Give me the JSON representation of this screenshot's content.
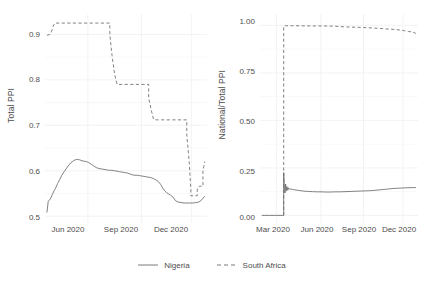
{
  "chart_data": [
    {
      "type": "line",
      "panel": "left",
      "title": "",
      "xlabel": "",
      "ylabel": "Total PPI",
      "ylim": [
        0.485,
        0.945
      ],
      "yticks": [
        0.5,
        0.6,
        0.7,
        0.8,
        0.9
      ],
      "ytick_labels": [
        "0.5",
        "0.6",
        "0.7",
        "0.8",
        "0.9"
      ],
      "xlim": [
        "2020-04-20",
        "2021-01-20"
      ],
      "xticks": [
        "Jun 2020",
        "Sep 2020",
        "Dec 2020"
      ],
      "xtick_positions": [
        0.265,
        0.595,
        0.905
      ],
      "grid": true,
      "legend_position": "bottom",
      "series": [
        {
          "name": "Nigeria",
          "style": "solid",
          "color": "#6b6b6b",
          "x": [
            0.012,
            0.02,
            0.028,
            0.036,
            0.046,
            0.056,
            0.066,
            0.078,
            0.09,
            0.102,
            0.116,
            0.13,
            0.144,
            0.158,
            0.172,
            0.186,
            0.2,
            0.214,
            0.228,
            0.242,
            0.256,
            0.27,
            0.286,
            0.3,
            0.316,
            0.332,
            0.348,
            0.364,
            0.38,
            0.396,
            0.412,
            0.428,
            0.444,
            0.46,
            0.476,
            0.492,
            0.508,
            0.524,
            0.54,
            0.556,
            0.572,
            0.588,
            0.604,
            0.62,
            0.636,
            0.652,
            0.668,
            0.684,
            0.7,
            0.714,
            0.726,
            0.738,
            0.75,
            0.762,
            0.776,
            0.79,
            0.806,
            0.822,
            0.84,
            0.858,
            0.876,
            0.894,
            0.912,
            0.93,
            0.948,
            0.962,
            0.974,
            0.986
          ],
          "y": [
            0.508,
            0.533,
            0.536,
            0.54,
            0.548,
            0.556,
            0.562,
            0.572,
            0.58,
            0.589,
            0.597,
            0.604,
            0.611,
            0.617,
            0.621,
            0.624,
            0.625,
            0.624,
            0.622,
            0.621,
            0.62,
            0.618,
            0.614,
            0.611,
            0.607,
            0.605,
            0.604,
            0.603,
            0.602,
            0.601,
            0.601,
            0.6,
            0.599,
            0.598,
            0.597,
            0.596,
            0.595,
            0.593,
            0.591,
            0.59,
            0.59,
            0.589,
            0.588,
            0.587,
            0.586,
            0.585,
            0.583,
            0.58,
            0.576,
            0.57,
            0.562,
            0.556,
            0.552,
            0.549,
            0.546,
            0.542,
            0.534,
            0.531,
            0.53,
            0.529,
            0.529,
            0.529,
            0.529,
            0.53,
            0.531,
            0.534,
            0.539,
            0.544
          ]
        },
        {
          "name": "South Africa",
          "style": "dashed",
          "color": "#6b6b6b",
          "x": [
            0.012,
            0.03,
            0.04,
            0.048,
            0.06,
            0.4,
            0.4,
            0.415,
            0.43,
            0.43,
            0.445,
            0.64,
            0.64,
            0.655,
            0.67,
            0.67,
            0.69,
            0.875,
            0.875,
            0.89,
            0.9,
            0.9,
            0.915,
            0.94,
            0.94,
            0.955,
            0.975,
            0.975,
            0.986
          ],
          "y": [
            0.898,
            0.9,
            0.906,
            0.916,
            0.925,
            0.925,
            0.9,
            0.85,
            0.812,
            0.812,
            0.79,
            0.79,
            0.76,
            0.735,
            0.713,
            0.713,
            0.712,
            0.712,
            0.68,
            0.62,
            0.56,
            0.545,
            0.545,
            0.545,
            0.562,
            0.566,
            0.566,
            0.6,
            0.62
          ]
        }
      ]
    },
    {
      "type": "line",
      "panel": "right",
      "title": "",
      "xlabel": "",
      "ylabel": "National/Total PPI",
      "ylim": [
        -0.04,
        1.06
      ],
      "yticks": [
        0.0,
        0.25,
        0.5,
        0.75,
        1.0
      ],
      "ytick_labels": [
        "0.00",
        "0.25",
        "0.50",
        "0.75",
        "1.00"
      ],
      "xlim": [
        "2020-02-10",
        "2021-01-20"
      ],
      "xticks": [
        "Mar 2020",
        "Jun 2020",
        "Sep 2020",
        "Dec 2020"
      ],
      "xtick_positions": [
        0.105,
        0.385,
        0.655,
        0.905
      ],
      "grid": true,
      "legend_position": "bottom",
      "series": [
        {
          "name": "Nigeria",
          "style": "solid",
          "color": "#6b6b6b",
          "x": [
            0.012,
            0.06,
            0.105,
            0.14,
            0.15,
            0.15,
            0.154,
            0.158,
            0.162,
            0.166,
            0.17,
            0.174,
            0.178,
            0.182,
            0.188,
            0.196,
            0.206,
            0.218,
            0.232,
            0.248,
            0.266,
            0.286,
            0.308,
            0.332,
            0.358,
            0.386,
            0.414,
            0.444,
            0.474,
            0.506,
            0.538,
            0.57,
            0.602,
            0.634,
            0.666,
            0.698,
            0.726,
            0.752,
            0.776,
            0.8,
            0.824,
            0.848,
            0.872,
            0.896,
            0.92,
            0.944,
            0.966,
            0.986
          ],
          "y": [
            0.0,
            0.0,
            0.0,
            0.0,
            0.0,
            0.225,
            0.15,
            0.118,
            0.165,
            0.128,
            0.152,
            0.133,
            0.146,
            0.136,
            0.14,
            0.138,
            0.137,
            0.135,
            0.133,
            0.131,
            0.129,
            0.127,
            0.126,
            0.125,
            0.124,
            0.124,
            0.123,
            0.123,
            0.124,
            0.124,
            0.125,
            0.126,
            0.127,
            0.128,
            0.129,
            0.13,
            0.132,
            0.134,
            0.136,
            0.138,
            0.14,
            0.142,
            0.143,
            0.144,
            0.145,
            0.146,
            0.146,
            0.147
          ]
        },
        {
          "name": "South Africa",
          "style": "dashed",
          "color": "#6b6b6b",
          "x": [
            0.15,
            0.15,
            0.16,
            0.2,
            0.26,
            0.33,
            0.4,
            0.47,
            0.54,
            0.61,
            0.68,
            0.74,
            0.79,
            0.83,
            0.86,
            0.89,
            0.915,
            0.94,
            0.96,
            0.975,
            0.986
          ],
          "y": [
            0.0,
            0.996,
            0.998,
            0.998,
            0.998,
            0.997,
            0.997,
            0.996,
            0.992,
            0.99,
            0.988,
            0.985,
            0.982,
            0.98,
            0.978,
            0.975,
            0.972,
            0.968,
            0.966,
            0.962,
            0.958
          ]
        }
      ]
    }
  ],
  "legend": {
    "items": [
      {
        "label": "Nigeria",
        "style": "solid"
      },
      {
        "label": "South Africa",
        "style": "dashed"
      }
    ]
  },
  "left_panel": {
    "ylabel": "Total PPI",
    "ytick_labels": [
      "0.9",
      "0.8",
      "0.7",
      "0.6",
      "0.5"
    ],
    "xtick_labels": [
      "Jun 2020",
      "Sep 2020",
      "Dec 2020"
    ]
  },
  "right_panel": {
    "ylabel": "National/Total PPI",
    "ytick_labels": [
      "1.00",
      "0.75",
      "0.50",
      "0.25",
      "0.00"
    ],
    "xtick_labels": [
      "Mar 2020",
      "Jun 2020",
      "Sep 2020",
      "Dec 2020"
    ]
  },
  "colors": {
    "line": "#6b6b6b",
    "grid": "#f0f0f0",
    "text": "#4d4d4d",
    "background": "#ffffff"
  }
}
